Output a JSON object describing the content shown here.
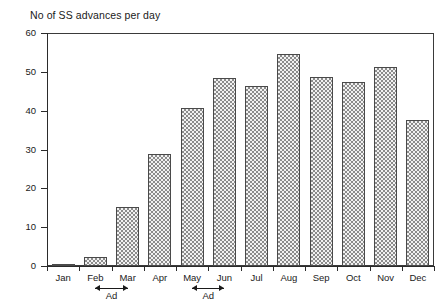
{
  "chart_data": {
    "type": "bar",
    "title": "No of SS advances per day",
    "xlabel": "",
    "ylabel": "",
    "ylim": [
      0,
      60
    ],
    "yticks": [
      0,
      10,
      20,
      30,
      40,
      50,
      60
    ],
    "ytick_labels": [
      "0",
      "10",
      "20",
      "30",
      "40",
      "50",
      "60"
    ],
    "grid": false,
    "legend": null,
    "categories": [
      "Jan",
      "Feb",
      "Mar",
      "Apr",
      "May",
      "Jun",
      "Jul",
      "Aug",
      "Sep",
      "Oct",
      "Nov",
      "Dec"
    ],
    "values": [
      0.5,
      2.2,
      15.3,
      28.8,
      40.8,
      48.5,
      46.4,
      54.6,
      48.6,
      47.5,
      51.2,
      37.6
    ],
    "annotations": [
      {
        "label": "Ad",
        "from": "Feb",
        "to": "Mar",
        "style": "double-headed-arrow",
        "position": "below-axis"
      },
      {
        "label": "Ad",
        "from": "May",
        "to": "Jun",
        "style": "double-headed-arrow",
        "position": "below-axis"
      }
    ]
  },
  "colors": {
    "axis": "#2b2b2b",
    "bar_fill": "#f2f2f2",
    "bar_pattern": "#8c8c8c",
    "bar_border": "#4a4a4a",
    "text": "#1a1a1a",
    "background": "#ffffff"
  }
}
